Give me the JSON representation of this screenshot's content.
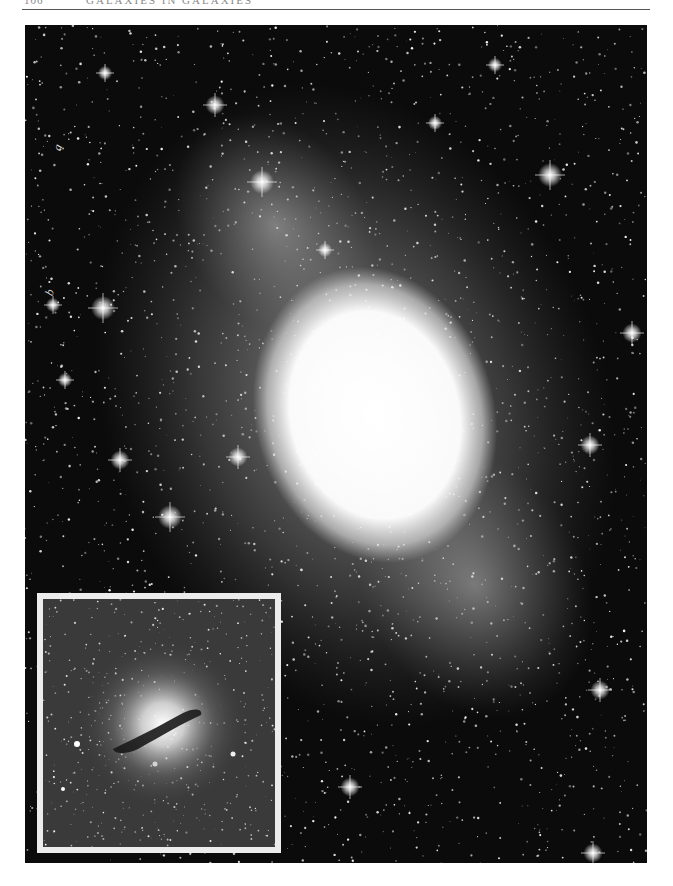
{
  "page": {
    "header": {
      "page_number": "106",
      "running_head": "Galaxies in Galaxies"
    },
    "plate": {
      "subject": "elliptical-galaxy-star-field",
      "labels": [
        {
          "text": "a",
          "x": 30,
          "y": 125
        },
        {
          "text": "b",
          "x": 22,
          "y": 270
        }
      ],
      "inset": {
        "subject": "galaxy-with-dust-lane",
        "border_color": "#ececec"
      }
    },
    "colors": {
      "background": "#ffffff",
      "sky": "#0b0b0b",
      "galaxy_core": "#ffffff",
      "inset_sky": "#3a3a3a"
    }
  }
}
